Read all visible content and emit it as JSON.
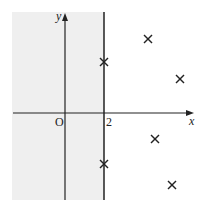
{
  "diagram": {
    "axes": {
      "x_label": "x",
      "y_label": "y",
      "origin_label": "O",
      "tick_label": "2"
    },
    "shaded_region": {
      "condition": "x < 2",
      "color": "#efefef"
    },
    "line": {
      "equation": "x = 2"
    },
    "points": [
      {
        "px": 104,
        "py": 62
      },
      {
        "px": 148,
        "py": 39
      },
      {
        "px": 180,
        "py": 79
      },
      {
        "px": 104,
        "py": 164
      },
      {
        "px": 155,
        "py": 139
      },
      {
        "px": 172,
        "py": 185
      }
    ],
    "colors": {
      "axis": "#222222",
      "shade": "#efefef",
      "marker": "#222222"
    }
  }
}
